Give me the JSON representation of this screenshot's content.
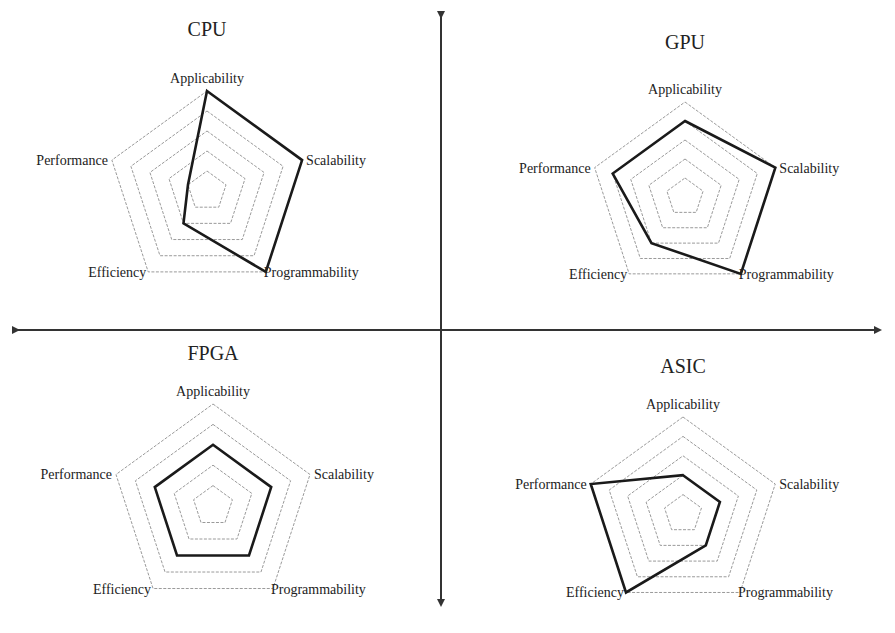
{
  "chart_data": [
    {
      "type": "radar",
      "title": "CPU",
      "axes": [
        "Applicability",
        "Scalability",
        "Programmability",
        "Efficiency",
        "Performance"
      ],
      "values": [
        5,
        5,
        5,
        2,
        1
      ],
      "scale": [
        0,
        5
      ],
      "rings": 5,
      "center": [
        207,
        191
      ],
      "radius": 100,
      "title_pos": [
        207,
        20
      ]
    },
    {
      "type": "radar",
      "title": "GPU",
      "axes": [
        "Applicability",
        "Scalability",
        "Programmability",
        "Efficiency",
        "Performance"
      ],
      "values": [
        4,
        5,
        5,
        3,
        4
      ],
      "scale": [
        0,
        5
      ],
      "rings": 5,
      "center": [
        685,
        197
      ],
      "radius": 95,
      "title_pos": [
        685,
        33
      ]
    },
    {
      "type": "radar",
      "title": "FPGA",
      "axes": [
        "Applicability",
        "Scalability",
        "Programmability",
        "Efficiency",
        "Performance"
      ],
      "values": [
        3,
        3,
        3,
        3,
        3
      ],
      "scale": [
        0,
        5
      ],
      "rings": 5,
      "center": [
        213,
        506
      ],
      "radius": 102,
      "title_pos": [
        213,
        344
      ]
    },
    {
      "type": "radar",
      "title": "ASIC",
      "axes": [
        "Applicability",
        "Scalability",
        "Programmability",
        "Efficiency",
        "Performance"
      ],
      "values": [
        2,
        2,
        2,
        5,
        5
      ],
      "scale": [
        0,
        5
      ],
      "rings": 5,
      "center": [
        683,
        514
      ],
      "radius": 97,
      "title_pos": [
        683,
        357
      ]
    }
  ],
  "quadrant_axes": {
    "horizontal": {
      "y": 330,
      "x1": 18,
      "x2": 880
    },
    "vertical": {
      "x": 441,
      "y1": 17,
      "y2": 605
    },
    "color": "#333333"
  },
  "colors": {
    "series_line": "#1a1a1a",
    "grid_ring": "#9a9a9a",
    "text": "#222222",
    "background": "#ffffff"
  }
}
